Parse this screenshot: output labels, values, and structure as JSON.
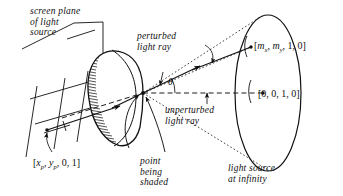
{
  "figure": {
    "background_color": "#ffffff",
    "ink_color": "#111111"
  },
  "labels": {
    "screen_plane": {
      "line1": "screen plane",
      "line2": "of light",
      "line3": "source"
    },
    "perturbed_ray": {
      "line1": "perturbed",
      "line2": "light ray"
    },
    "unperturbed_ray": {
      "line1": "unperturbed",
      "line2": "light ray"
    },
    "point_being_shaded": {
      "line1": "point",
      "line2": "being",
      "line3": "shaded"
    },
    "light_source_at_infinity": {
      "line1": "light source",
      "line2": "at infinity"
    },
    "angle_theta": "θ"
  },
  "vectors": {
    "screen_point": {
      "open": "[",
      "x": "x",
      "xsub": "p",
      "sep1": ", ",
      "y": "y",
      "ysub": "p",
      "rest": ", 0, 1]"
    },
    "perturbed_direction": {
      "open": "[",
      "m1": "m",
      "m1sub": "x",
      "sep1": ", ",
      "m2": "m",
      "m2sub": "y",
      "rest": ", 1, 0]"
    },
    "unperturbed_direction": "[0, 0, 1, 0]"
  },
  "elements": {
    "shaded_object": "egg-shaped-solid-with-hatched-terminator",
    "light_disc": "tall-ellipse-at-infinity",
    "screen_grid": "crossing-lines-screen-plane",
    "cone": "dotted-cone-from-shading-point"
  }
}
